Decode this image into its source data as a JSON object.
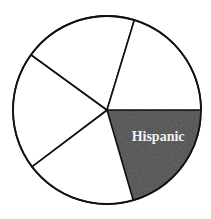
{
  "chart_data": {
    "type": "pie",
    "title": "",
    "categories": [
      "Hispanic",
      "",
      "",
      "",
      ""
    ],
    "values": [
      20.5,
      19.2,
      20.3,
      19.7,
      20.3
    ],
    "start_angle_deg": 0,
    "direction": "clockwise",
    "highlighted": "Hispanic",
    "colors": [
      "#4a4a4a",
      "#ffffff",
      "#ffffff",
      "#ffffff",
      "#ffffff"
    ],
    "labels_visible": [
      "Hispanic"
    ],
    "legend": "none"
  },
  "geometry": {
    "cx": 107,
    "cy": 110,
    "r": 94
  }
}
